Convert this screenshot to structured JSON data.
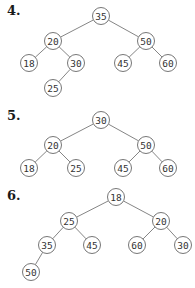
{
  "trees": [
    {
      "label": "4.",
      "label_pos": [
        7,
        3
      ],
      "nodes": [
        {
          "id": "a",
          "value": "35",
          "x": 101,
          "y": 16
        },
        {
          "id": "b",
          "value": "20",
          "x": 53,
          "y": 41
        },
        {
          "id": "c",
          "value": "50",
          "x": 146,
          "y": 41
        },
        {
          "id": "d",
          "value": "18",
          "x": 29,
          "y": 63
        },
        {
          "id": "e",
          "value": "30",
          "x": 76,
          "y": 63
        },
        {
          "id": "f",
          "value": "45",
          "x": 123,
          "y": 63
        },
        {
          "id": "g",
          "value": "60",
          "x": 168,
          "y": 63
        },
        {
          "id": "h",
          "value": "25",
          "x": 53,
          "y": 88
        }
      ],
      "edges": [
        [
          "a",
          "b"
        ],
        [
          "a",
          "c"
        ],
        [
          "b",
          "d"
        ],
        [
          "b",
          "e"
        ],
        [
          "c",
          "f"
        ],
        [
          "c",
          "g"
        ],
        [
          "e",
          "h"
        ]
      ]
    },
    {
      "label": "5.",
      "label_pos": [
        7,
        108
      ],
      "nodes": [
        {
          "id": "a",
          "value": "30",
          "x": 101,
          "y": 120
        },
        {
          "id": "b",
          "value": "20",
          "x": 53,
          "y": 145
        },
        {
          "id": "c",
          "value": "50",
          "x": 146,
          "y": 145
        },
        {
          "id": "d",
          "value": "18",
          "x": 29,
          "y": 168
        },
        {
          "id": "e",
          "value": "25",
          "x": 76,
          "y": 168
        },
        {
          "id": "f",
          "value": "45",
          "x": 123,
          "y": 168
        },
        {
          "id": "g",
          "value": "60",
          "x": 168,
          "y": 168
        }
      ],
      "edges": [
        [
          "a",
          "b"
        ],
        [
          "a",
          "c"
        ],
        [
          "b",
          "d"
        ],
        [
          "b",
          "e"
        ],
        [
          "c",
          "f"
        ],
        [
          "c",
          "g"
        ]
      ]
    },
    {
      "label": "6.",
      "label_pos": [
        7,
        188
      ],
      "nodes": [
        {
          "id": "a",
          "value": "18",
          "x": 116,
          "y": 197
        },
        {
          "id": "b",
          "value": "25",
          "x": 69,
          "y": 221
        },
        {
          "id": "c",
          "value": "20",
          "x": 161,
          "y": 221
        },
        {
          "id": "d",
          "value": "35",
          "x": 47,
          "y": 245
        },
        {
          "id": "e",
          "value": "45",
          "x": 92,
          "y": 245
        },
        {
          "id": "f",
          "value": "60",
          "x": 137,
          "y": 245
        },
        {
          "id": "g",
          "value": "30",
          "x": 183,
          "y": 245
        },
        {
          "id": "h",
          "value": "50",
          "x": 31,
          "y": 272
        }
      ],
      "edges": [
        [
          "a",
          "b"
        ],
        [
          "a",
          "c"
        ],
        [
          "b",
          "d"
        ],
        [
          "b",
          "e"
        ],
        [
          "c",
          "f"
        ],
        [
          "c",
          "g"
        ],
        [
          "d",
          "h"
        ]
      ]
    }
  ],
  "node_radius": 8.5
}
